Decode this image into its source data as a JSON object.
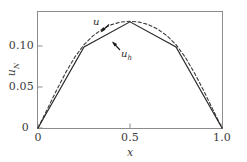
{
  "figure": {
    "background_color": "#ffffff",
    "frame_color": "#8c8c8c",
    "text_color": "#3b3b3b"
  },
  "axes": {
    "xlabel": "x",
    "ylabel": "u",
    "ylabel_sub": "N",
    "ylabel_text": "u_N",
    "xticks": [
      "0",
      "0.5",
      "1.0"
    ],
    "yticks": [
      "0",
      "0.05",
      "0.10"
    ]
  },
  "annotations": {
    "exact": "u",
    "discrete": "u",
    "discrete_sub": "h"
  },
  "chart_data": {
    "type": "line",
    "title": "",
    "xlabel": "x",
    "ylabel": "u_N",
    "xlim": [
      0.0,
      1.0
    ],
    "ylim": [
      0.0,
      0.135
    ],
    "xticks": [
      0.0,
      0.5,
      1.0
    ],
    "xtick_labels": [
      "0",
      "0.5",
      "1.0"
    ],
    "yticks": [
      0.0,
      0.05,
      0.1
    ],
    "ytick_labels": [
      "0",
      "0.05",
      "0.10"
    ],
    "grid": false,
    "legend": "none",
    "annotations": [
      {
        "text": "u",
        "x": 0.295,
        "y": 0.125,
        "points_to": [
          0.36,
          0.108
        ]
      },
      {
        "text": "u_h",
        "x": 0.47,
        "y": 0.072,
        "points_to": [
          0.405,
          0.098
        ]
      }
    ],
    "series": [
      {
        "name": "u",
        "style": "dashed",
        "color": "#3a3a3a",
        "x": [
          0.0,
          0.05,
          0.1,
          0.15,
          0.2,
          0.25,
          0.3,
          0.35,
          0.4,
          0.45,
          0.5,
          0.55,
          0.6,
          0.65,
          0.7,
          0.75,
          0.8,
          0.85,
          0.9,
          0.95,
          1.0
        ],
        "y": [
          0.0,
          0.0215,
          0.0432,
          0.0637,
          0.0818,
          0.0962,
          0.1066,
          0.1142,
          0.1193,
          0.1222,
          0.1232,
          0.1222,
          0.1193,
          0.1142,
          0.1066,
          0.0962,
          0.0818,
          0.0637,
          0.0432,
          0.0215,
          0.0
        ]
      },
      {
        "name": "u_h",
        "style": "solid",
        "color": "#2b2b2b",
        "x": [
          0.0,
          0.25,
          0.5,
          0.75,
          1.0
        ],
        "y": [
          0.0,
          0.0935,
          0.1225,
          0.0935,
          0.0
        ]
      }
    ]
  }
}
